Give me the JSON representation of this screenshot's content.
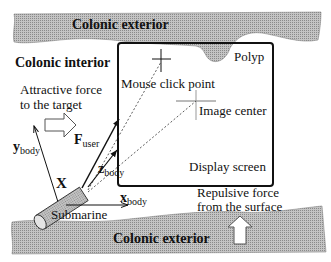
{
  "diagram": {
    "regions": {
      "top_exterior": "Colonic exterior",
      "interior": "Colonic interior",
      "bottom_exterior": "Colonic exterior"
    },
    "labels": {
      "polyp": "Polyp",
      "mouse_click_point": "Mouse click point",
      "image_center": "Image center",
      "display_screen": "Display screen",
      "attractive_force_line1": "Attractive force",
      "attractive_force_line2": "to the target",
      "repulsive_force_line1": "Repulsive force",
      "repulsive_force_line2": "from the surface",
      "submarine": "Submarine",
      "origin": "X"
    },
    "vectors": {
      "f_user": {
        "main": "F",
        "sub": "user"
      },
      "x_body": {
        "main": "x",
        "sub": "body"
      },
      "y_body": {
        "main": "y",
        "sub": "body"
      },
      "z_body": {
        "main": "z",
        "sub": "body"
      }
    },
    "colors": {
      "wall_fill": "#b8b8b8",
      "line": "#111111",
      "background": "#ffffff"
    }
  }
}
